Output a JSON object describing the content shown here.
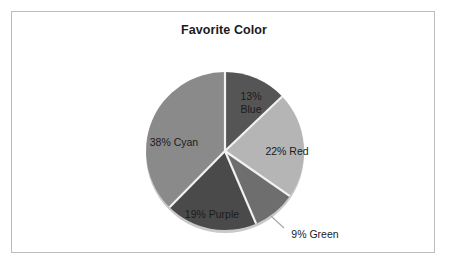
{
  "chart_data": {
    "type": "pie",
    "title": "Favorite Color",
    "categories": [
      "Blue",
      "Red",
      "Green",
      "Purple",
      "Cyan"
    ],
    "values": [
      13,
      22,
      9,
      19,
      38
    ],
    "unit": "%",
    "labels": [
      {
        "name": "blue",
        "text_line1": "13%",
        "text_line2": "Blue",
        "full": "13% Blue",
        "value": 13,
        "position": "inside",
        "color": "#555555"
      },
      {
        "name": "red",
        "text_line1": "22% Red",
        "text_line2": "",
        "full": "22% Red",
        "value": 22,
        "position": "inside",
        "color": "#b5b5b5"
      },
      {
        "name": "green",
        "text_line1": "9% Green",
        "text_line2": "",
        "full": "9% Green",
        "value": 9,
        "position": "outside",
        "color": "#6e6e6e"
      },
      {
        "name": "purple",
        "text_line1": "19% Purple",
        "text_line2": "",
        "full": "19% Purple",
        "value": 19,
        "position": "inside",
        "color": "#4a4a4a"
      },
      {
        "name": "cyan",
        "text_line1": "38% Cyan",
        "text_line2": "",
        "full": "38% Cyan",
        "value": 38,
        "position": "inside",
        "color": "#8a8a8a"
      }
    ],
    "start_angle_deg": 0,
    "direction": "clockwise",
    "legend": "none",
    "grid": false,
    "xlabel": "",
    "ylabel": "",
    "colors": {
      "blue": "#555555",
      "red": "#b5b5b5",
      "green": "#6e6e6e",
      "purple": "#4a4a4a",
      "cyan": "#8a8a8a",
      "separator": "#f2f2f2",
      "border": "#b9bcc0",
      "shadow": "#c9c9c9",
      "background": "#ffffff",
      "text": "#1b1b1b"
    }
  }
}
